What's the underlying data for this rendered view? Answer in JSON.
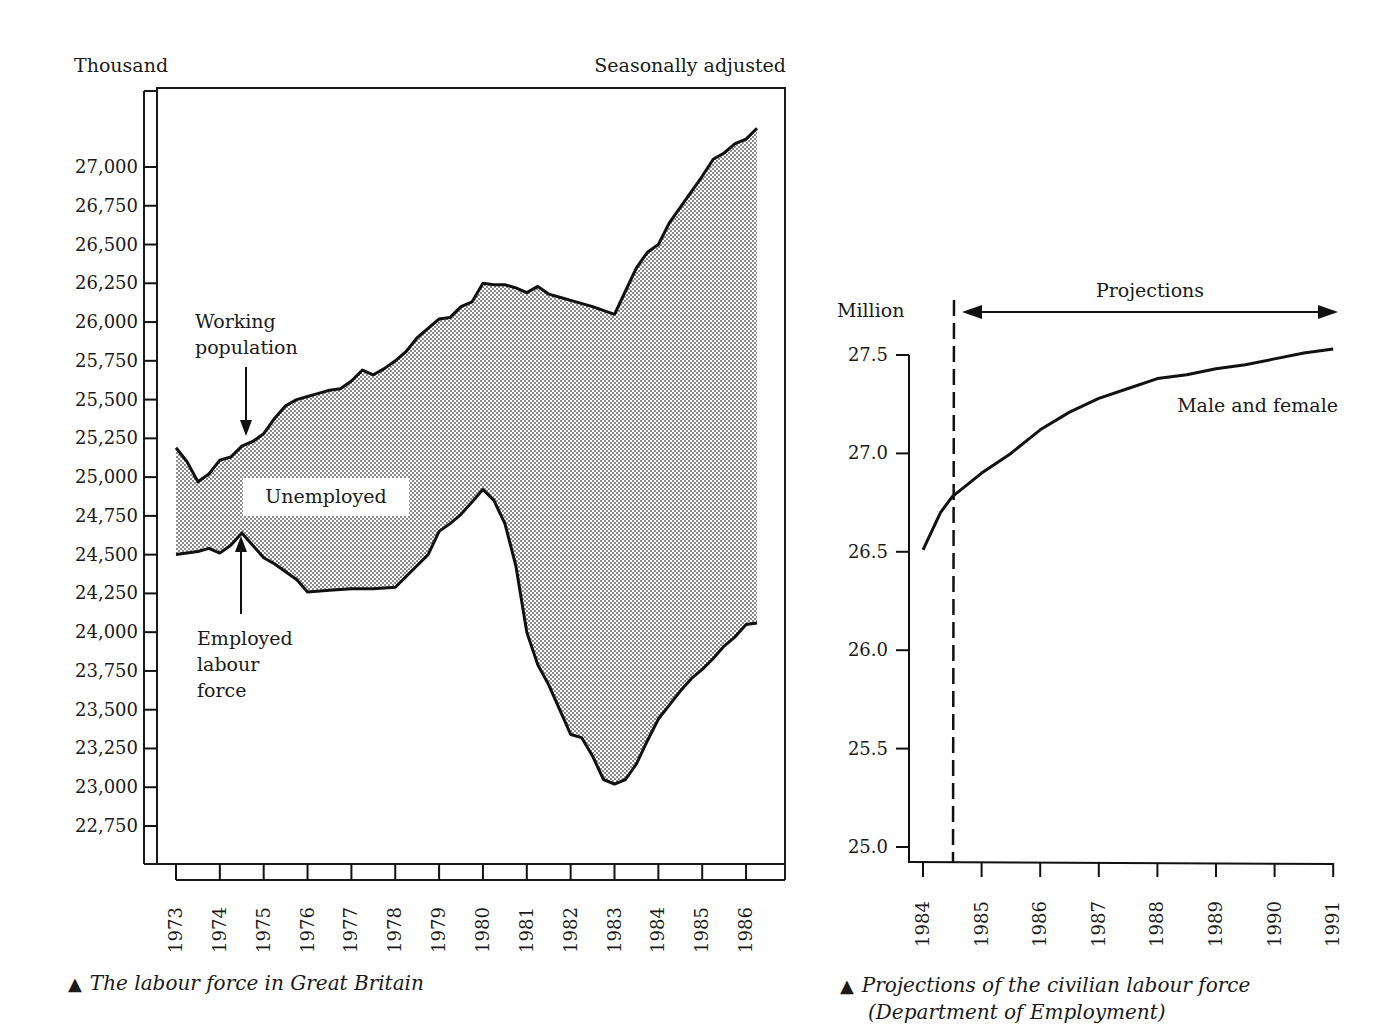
{
  "chart_data": [
    {
      "type": "area",
      "title": "The labour force in Great Britain",
      "caption": "The labour force in Great Britain",
      "unit_label": "Thousand",
      "note": "Seasonally adjusted",
      "xlabel": "",
      "ylabel": "Thousand",
      "ylim": [
        22500,
        27500
      ],
      "xlim": [
        1973,
        1986.3
      ],
      "y_ticks": [
        "27,000",
        "26,750",
        "26,500",
        "26,250",
        "26,000",
        "25,750",
        "25,500",
        "25,250",
        "25,000",
        "24,750",
        "24,500",
        "24,250",
        "24,000",
        "23,750",
        "23,500",
        "23,250",
        "23,000",
        "22,750"
      ],
      "y_tick_values": [
        27000,
        26750,
        26500,
        26250,
        26000,
        25750,
        25500,
        25250,
        25000,
        24750,
        24500,
        24250,
        24000,
        23750,
        23500,
        23250,
        23000,
        22750
      ],
      "x_ticks": [
        "1973",
        "1974",
        "1975",
        "1976",
        "1977",
        "1978",
        "1979",
        "1980",
        "1981",
        "1982",
        "1983",
        "1984",
        "1985",
        "1986"
      ],
      "fill_label": "Unemployed",
      "annotations": [
        "Working population",
        "Employed labour force",
        "Unemployed"
      ],
      "series": [
        {
          "name": "Working population",
          "x": [
            1973.0,
            1973.25,
            1973.5,
            1973.75,
            1974.0,
            1974.25,
            1974.5,
            1974.75,
            1975.0,
            1975.25,
            1975.5,
            1975.75,
            1976.0,
            1976.25,
            1976.5,
            1976.75,
            1977.0,
            1977.25,
            1977.5,
            1977.75,
            1978.0,
            1978.25,
            1978.5,
            1978.75,
            1979.0,
            1979.25,
            1979.5,
            1979.75,
            1980.0,
            1980.25,
            1980.5,
            1980.75,
            1981.0,
            1981.25,
            1981.5,
            1981.75,
            1982.0,
            1982.5,
            1983.0,
            1983.25,
            1983.5,
            1983.75,
            1984.0,
            1984.25,
            1984.5,
            1984.75,
            1985.0,
            1985.25,
            1985.5,
            1985.75,
            1986.0,
            1986.25
          ],
          "values": [
            25190,
            25100,
            24970,
            25020,
            25110,
            25130,
            25200,
            25230,
            25280,
            25380,
            25460,
            25500,
            25520,
            25540,
            25560,
            25570,
            25620,
            25690,
            25660,
            25700,
            25750,
            25810,
            25900,
            25960,
            26020,
            26030,
            26100,
            26130,
            26250,
            26240,
            26240,
            26220,
            26190,
            26230,
            26180,
            26160,
            26140,
            26100,
            26050,
            26200,
            26350,
            26450,
            26500,
            26640,
            26740,
            26840,
            26940,
            27050,
            27090,
            27150,
            27180,
            27250
          ]
        },
        {
          "name": "Employed labour force",
          "x": [
            1973.0,
            1973.25,
            1973.5,
            1973.75,
            1974.0,
            1974.25,
            1974.5,
            1974.75,
            1975.0,
            1975.25,
            1975.5,
            1975.75,
            1976.0,
            1976.5,
            1977.0,
            1977.5,
            1978.0,
            1978.25,
            1978.5,
            1978.75,
            1979.0,
            1979.25,
            1979.5,
            1979.75,
            1980.0,
            1980.25,
            1980.5,
            1980.75,
            1981.0,
            1981.25,
            1981.5,
            1981.75,
            1982.0,
            1982.25,
            1982.5,
            1982.75,
            1983.0,
            1983.25,
            1983.5,
            1983.75,
            1984.0,
            1984.25,
            1984.5,
            1984.75,
            1985.0,
            1985.25,
            1985.5,
            1985.75,
            1986.0,
            1986.25
          ],
          "values": [
            24500,
            24510,
            24520,
            24540,
            24510,
            24560,
            24640,
            24560,
            24480,
            24440,
            24390,
            24340,
            24260,
            24270,
            24280,
            24280,
            24290,
            24360,
            24430,
            24500,
            24650,
            24700,
            24760,
            24840,
            24920,
            24850,
            24700,
            24430,
            24000,
            23790,
            23660,
            23500,
            23340,
            23320,
            23200,
            23050,
            23020,
            23050,
            23150,
            23300,
            23440,
            23530,
            23620,
            23700,
            23760,
            23830,
            23910,
            23970,
            24050,
            24060
          ]
        }
      ]
    },
    {
      "type": "line",
      "title": "Projections of the civilian labour force (Department of Employment)",
      "caption": "Projections of the civilian labour force (Department of Employment)",
      "unit_label": "Million",
      "xlabel": "",
      "ylabel": "Million",
      "ylim": [
        24.9,
        27.6
      ],
      "xlim": [
        1983.85,
        1991
      ],
      "y_ticks": [
        "27.5",
        "27.0",
        "26.5",
        "26.0",
        "25.5",
        "25.0"
      ],
      "y_tick_values": [
        27.5,
        27.0,
        26.5,
        26.0,
        25.5,
        25.0
      ],
      "x_ticks": [
        "1984",
        "1985",
        "1986",
        "1987",
        "1988",
        "1989",
        "1990",
        "1991"
      ],
      "projection_start": 1984.5,
      "projection_label": "Projections",
      "series": [
        {
          "name": "Male and female",
          "x": [
            1984.0,
            1984.3,
            1984.5,
            1984.75,
            1985.0,
            1985.25,
            1985.5,
            1985.75,
            1986.0,
            1986.5,
            1987.0,
            1987.5,
            1988.0,
            1988.5,
            1989.0,
            1989.5,
            1990.0,
            1990.5,
            1991.0
          ],
          "values": [
            26.51,
            26.7,
            26.78,
            26.84,
            26.9,
            26.95,
            27.0,
            27.06,
            27.12,
            27.21,
            27.28,
            27.33,
            27.38,
            27.4,
            27.43,
            27.45,
            27.48,
            27.51,
            27.53
          ]
        }
      ]
    }
  ],
  "left_chart": {
    "unit_label": "Thousand",
    "note": "Seasonally adjusted",
    "label_working_1": "Working",
    "label_working_2": "population",
    "label_unemployed": "Unemployed",
    "label_employed_1": "Employed",
    "label_employed_2": "labour",
    "label_employed_3": "force",
    "caption": "The labour force in Great Britain"
  },
  "right_chart": {
    "unit_label": "Million",
    "projection_label": "Projections",
    "series_label": "Male and female",
    "caption_line1": "Projections of the civilian labour force",
    "caption_line2": "(Department of Employment)"
  },
  "caption_marker": "▲"
}
